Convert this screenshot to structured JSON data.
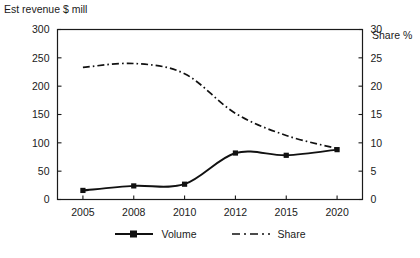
{
  "chart_data": {
    "type": "line",
    "title": "",
    "xlabel": "",
    "ylabel": "Est revenue $ mill",
    "y2label": "Share %",
    "categories": [
      "2005",
      "2008",
      "2010",
      "2012",
      "2015",
      "2020"
    ],
    "ylim": [
      0,
      300
    ],
    "y2lim": [
      0,
      30
    ],
    "yticks": [
      "0",
      "50",
      "100",
      "150",
      "200",
      "250",
      "300"
    ],
    "y2ticks": [
      "0",
      "5",
      "10",
      "15",
      "20",
      "25",
      "30"
    ],
    "grid": false,
    "legend_position": "bottom-center",
    "series": [
      {
        "name": "Volume",
        "axis": "left",
        "style": "solid-with-square-markers",
        "values": [
          16,
          24,
          27,
          82,
          78,
          88
        ]
      },
      {
        "name": "Share",
        "axis": "right",
        "style": "dash-dot",
        "values": [
          23.3,
          24.0,
          22.2,
          15.2,
          11.3,
          9.0
        ]
      }
    ]
  },
  "axes": {
    "left_title": "Est revenue $ mill",
    "right_title": "Share %"
  },
  "legend": {
    "items": [
      {
        "label": "Volume",
        "marker": "line-square-marker-icon"
      },
      {
        "label": "Share",
        "marker": "dash-dot-line-icon"
      }
    ]
  }
}
